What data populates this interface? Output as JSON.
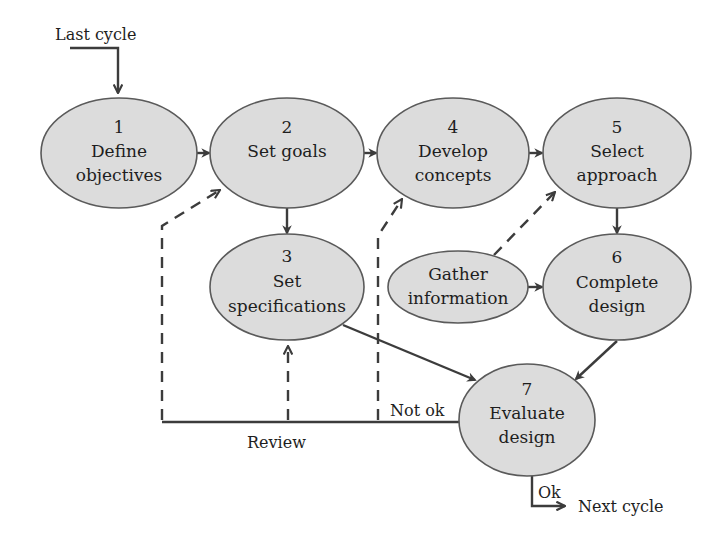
{
  "diagram": {
    "type": "design-process-cycle",
    "colors": {
      "node_fill": "#dcdcdc",
      "node_stroke": "#5a5a5a",
      "line": "#3c3c3c",
      "text": "#1e1e1e",
      "background": "#ffffff"
    },
    "entry_label": "Last cycle",
    "exit_label": "Next cycle",
    "ok_label": "Ok",
    "not_ok_label": "Not ok",
    "review_label": "Review",
    "nodes": [
      {
        "id": "1",
        "number": "1",
        "line1": "Define",
        "line2": "objectives"
      },
      {
        "id": "2",
        "number": "2",
        "line1": "Set goals",
        "line2": ""
      },
      {
        "id": "3",
        "number": "3",
        "line1": "Set",
        "line2": "specifications"
      },
      {
        "id": "4",
        "number": "4",
        "line1": "Develop",
        "line2": "concepts"
      },
      {
        "id": "5",
        "number": "5",
        "line1": "Select",
        "line2": "approach"
      },
      {
        "id": "gather",
        "number": "",
        "line1": "Gather",
        "line2": "information"
      },
      {
        "id": "6",
        "number": "6",
        "line1": "Complete",
        "line2": "design"
      },
      {
        "id": "7",
        "number": "7",
        "line1": "Evaluate",
        "line2": "design"
      }
    ],
    "edges": [
      {
        "from": "Last cycle",
        "to": "1",
        "style": "solid"
      },
      {
        "from": "1",
        "to": "2",
        "style": "solid"
      },
      {
        "from": "2",
        "to": "4",
        "style": "solid"
      },
      {
        "from": "4",
        "to": "5",
        "style": "solid"
      },
      {
        "from": "2",
        "to": "3",
        "style": "solid"
      },
      {
        "from": "5",
        "to": "6",
        "style": "solid"
      },
      {
        "from": "gather",
        "to": "6",
        "style": "solid"
      },
      {
        "from": "gather",
        "to": "5",
        "style": "dashed"
      },
      {
        "from": "3",
        "to": "7",
        "style": "solid"
      },
      {
        "from": "6",
        "to": "7",
        "style": "solid"
      },
      {
        "from": "7",
        "to": "review",
        "style": "solid",
        "label": "Not ok"
      },
      {
        "from": "review",
        "to": "2",
        "style": "dashed"
      },
      {
        "from": "review",
        "to": "3",
        "style": "dashed"
      },
      {
        "from": "review",
        "to": "4",
        "style": "dashed"
      },
      {
        "from": "7",
        "to": "Next cycle",
        "style": "solid",
        "label": "Ok"
      }
    ]
  }
}
